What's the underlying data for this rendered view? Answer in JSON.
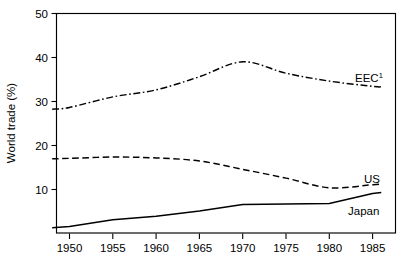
{
  "chart_data": {
    "type": "line",
    "title": "",
    "subtitle": "",
    "xlabel": "",
    "ylabel": "World trade (%)",
    "xlim": [
      1948,
      1987
    ],
    "ylim": [
      0,
      50
    ],
    "grid": false,
    "legend_position": "right-inline-labels",
    "xticks": [
      "1950",
      "1955",
      "1960",
      "1965",
      "1970",
      "1975",
      "1980",
      "1985"
    ],
    "xtick_values": [
      1950,
      1955,
      1960,
      1965,
      1970,
      1975,
      1980,
      1985
    ],
    "yticks": [
      "0",
      "10",
      "20",
      "30",
      "40",
      "50"
    ],
    "ytick_values": [
      0,
      10,
      20,
      30,
      40,
      50
    ],
    "ytick_labels_shown": [
      "10",
      "20",
      "30",
      "40",
      "50"
    ],
    "x": [
      1948,
      1950,
      1955,
      1960,
      1965,
      1970,
      1975,
      1980,
      1985,
      1986
    ],
    "series": [
      {
        "name": "EEC",
        "label": "EEC",
        "label_superscript": "1",
        "line_style": "dash-dot",
        "color": "#000000",
        "values": [
          28.2,
          28.6,
          31.0,
          32.6,
          35.6,
          39.0,
          36.4,
          34.6,
          33.4,
          33.3
        ]
      },
      {
        "name": "US",
        "label": "US",
        "label_superscript": "",
        "line_style": "dashed",
        "color": "#000000",
        "values": [
          16.9,
          17.0,
          17.3,
          17.1,
          16.4,
          14.5,
          12.5,
          10.3,
          11.0,
          11.2
        ]
      },
      {
        "name": "Japan",
        "label": "Japan",
        "label_superscript": "",
        "line_style": "solid",
        "color": "#000000",
        "values": [
          1.2,
          1.5,
          3.0,
          3.8,
          5.0,
          6.5,
          6.6,
          6.7,
          9.0,
          9.2
        ]
      }
    ],
    "annotations": [
      {
        "text": "EEC",
        "superscript": "1",
        "series": "EEC"
      },
      {
        "text": "US",
        "superscript": "",
        "series": "US"
      },
      {
        "text": "Japan",
        "superscript": "",
        "series": "Japan"
      }
    ]
  },
  "axes": {
    "y_axis_title": "World trade (%)"
  }
}
